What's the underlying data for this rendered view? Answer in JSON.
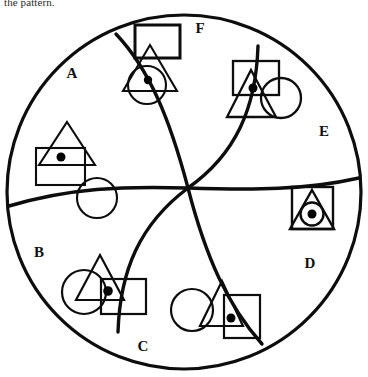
{
  "prompt": {
    "text": "the pattern."
  },
  "figure": {
    "type": "pinwheel-segmented-circle",
    "title": "",
    "stroke_color": "#0d0d0d",
    "fill_color": "#ffffff",
    "dot_color": "#000000",
    "outer_circle": {
      "cx": 184,
      "cy": 192,
      "r": 177
    },
    "center_point": {
      "x": 188,
      "y": 188
    },
    "region_count": 6,
    "regions": [
      {
        "id": "A",
        "label": "A",
        "label_x": 72,
        "label_y": 78,
        "shapes": [
          "triangle",
          "square",
          "dot",
          "circle"
        ],
        "description": "triangle overlapping square with filled dot, plus separate empty circle"
      },
      {
        "id": "B",
        "label": "B",
        "label_x": 39,
        "label_y": 257,
        "shapes": [
          "circle",
          "triangle",
          "square",
          "dot"
        ],
        "description": "circle overlapping triangle overlapping square with filled dot"
      },
      {
        "id": "C",
        "label": "C",
        "label_x": 143,
        "label_y": 351,
        "shapes": [
          "circle",
          "triangle",
          "square",
          "dot"
        ],
        "description": "circle overlapping triangle overlapping square with filled dot"
      },
      {
        "id": "D",
        "label": "D",
        "label_x": 310,
        "label_y": 268,
        "shapes": [
          "square",
          "triangle",
          "circle",
          "dot"
        ],
        "description": "square containing triangle containing circle containing filled dot, fully nested"
      },
      {
        "id": "E",
        "label": "E",
        "label_x": 324,
        "label_y": 136,
        "shapes": [
          "square",
          "triangle",
          "dot",
          "circle"
        ],
        "description": "square overlapping triangle with filled dot, circle overlapping at right"
      },
      {
        "id": "F",
        "label": "F",
        "label_x": 200,
        "label_y": 33,
        "shapes": [
          "square",
          "triangle",
          "circle",
          "dot"
        ],
        "description": "square above triangle above circle with filled dot"
      }
    ]
  }
}
